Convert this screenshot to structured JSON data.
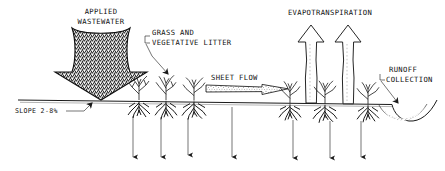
{
  "figure": {
    "title_semantic": "overland-flow-land-treatment-schematic",
    "background_color": "#ffffff",
    "ink_color": "#1a1a1a"
  },
  "labels": {
    "applied_wastewater_line1": "APPLIED",
    "applied_wastewater_line2": "WASTEWATER",
    "grass_line1": "GRASS AND",
    "grass_line2": "VEGETATIVE LITTER",
    "sheet_flow": "SHEET FLOW",
    "evapotranspiration": "EVAPOTRANSPIRATION",
    "runoff_line1": "RUNOFF",
    "runoff_line2": "COLLECTION",
    "slope": "SLOPE 2-8%"
  },
  "icons": {
    "applied_wastewater_arrow": "down-arrow-stippled-icon",
    "sheet_flow_arrow": "right-arrow-stippled-icon",
    "evapotranspiration_arrow_left": "up-arrow-icon",
    "evapotranspiration_arrow_right": "up-arrow-icon",
    "percolation_arrow": "down-arrow-icon",
    "ground_line": "ground-surface-icon",
    "plant": "grass-plant-with-roots-icon",
    "runoff_ditch": "collection-ditch-icon"
  },
  "geometry": {
    "ground_line_y": 104,
    "ground_left_x": 18,
    "ground_right_x": 392,
    "percolation_arrow_x": [
      133,
      161,
      188,
      232,
      293,
      330,
      361
    ],
    "percolation_arrow_top_y": 116,
    "percolation_arrow_bottom_y": 160,
    "plant_x": [
      139,
      166,
      194,
      290,
      325,
      368
    ],
    "evapotranspiration_arrow_x": [
      311,
      348
    ],
    "evapotranspiration_arrow_top_y": 24,
    "slope_percent_min": 2,
    "slope_percent_max": 8
  }
}
